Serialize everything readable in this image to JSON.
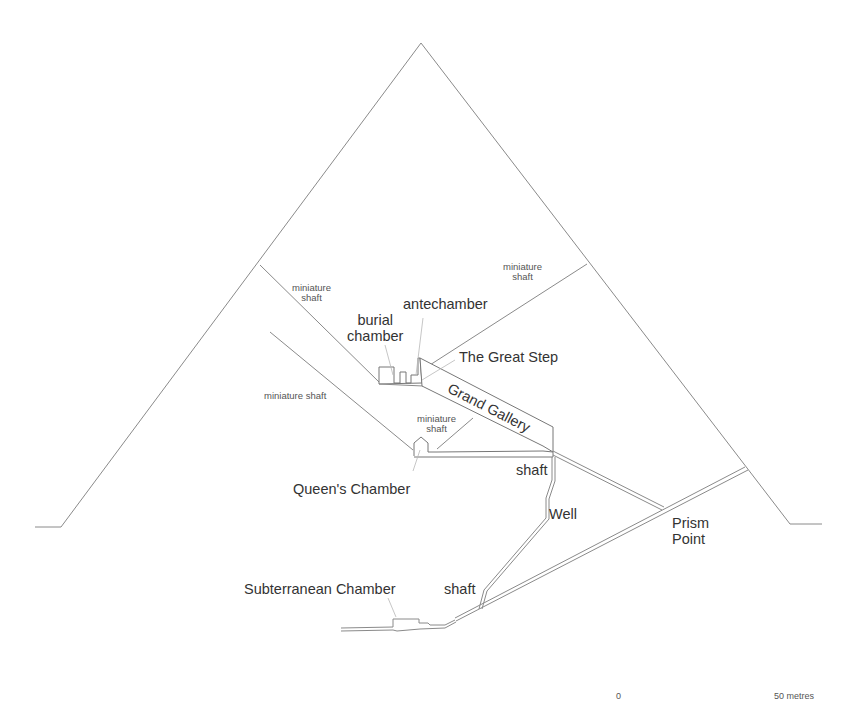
{
  "diagram": {
    "colors": {
      "line": "#8a8a8a",
      "text": "#333333",
      "background": "#ffffff"
    },
    "labels": {
      "miniature_shaft_upper_left": [
        "miniature",
        "shaft"
      ],
      "miniature_shaft_upper_right": [
        "miniature",
        "shaft"
      ],
      "miniature_shaft_lower_left": "miniature shaft",
      "miniature_shaft_inner": [
        "miniature",
        "shaft"
      ],
      "burial_chamber": [
        "burial",
        "chamber"
      ],
      "antechamber": "antechamber",
      "great_step": "The Great Step",
      "grand_gallery": "Grand Gallery",
      "queens_chamber": "Queen's Chamber",
      "shaft_upper": "shaft",
      "well": "Well",
      "prism_point": [
        "Prism",
        "Point"
      ],
      "subterranean_chamber": "Subterranean Chamber",
      "shaft_lower": "shaft"
    },
    "scale_bar": {
      "start": "0",
      "end": "50 metres"
    }
  }
}
